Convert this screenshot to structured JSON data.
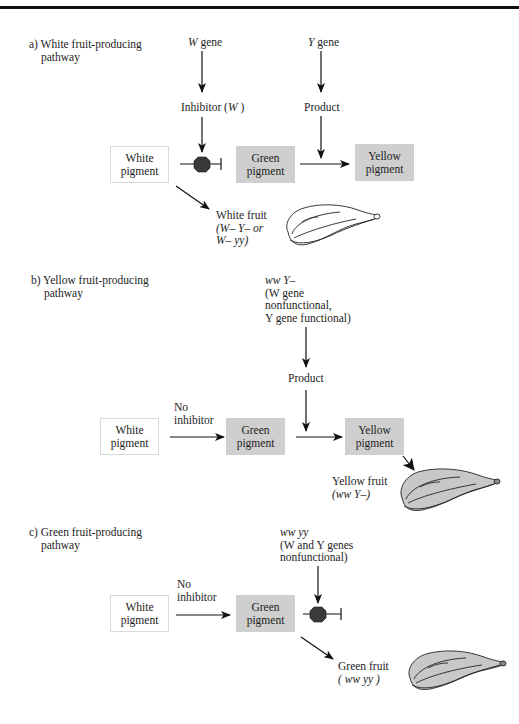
{
  "colors": {
    "pigment_box_fill": "#cfcfcf",
    "white_box_border": "#dadada",
    "inhibitor_dot": "#3a3a3a",
    "line": "#111111",
    "fruit_fill_shaded": "#c8c8c8"
  },
  "panel_a": {
    "title_line1": "a) White fruit-producing",
    "title_line2": "pathway",
    "w_gene": {
      "symbol": "W",
      "text": " gene"
    },
    "y_gene": {
      "symbol": "Y",
      "text": " gene"
    },
    "inhibitor": {
      "prefix": "Inhibitor (",
      "symbol": "W",
      "suffix": " )"
    },
    "product": "Product",
    "boxes": {
      "white": "White\npigment",
      "green": "Green\npigment",
      "yellow": "Yellow\npigment"
    },
    "fruit_label": "White fruit",
    "genotype_line1": "(W– Y– or",
    "genotype_line2": "W– yy)"
  },
  "panel_b": {
    "title_line1": "b) Yellow fruit-producing",
    "title_line2": "pathway",
    "genotype": "ww  Y–",
    "note_line1": "(W gene",
    "note_line2": "nonfunctional,",
    "note_line3": "Y gene functional)",
    "product": "Product",
    "no_inhibitor_line1": "No",
    "no_inhibitor_line2": "inhibitor",
    "boxes": {
      "white": "White\npigment",
      "green": "Green\npigment",
      "yellow": "Yellow\npigment"
    },
    "fruit_label": "Yellow fruit",
    "fruit_genotype": "(ww  Y–)"
  },
  "panel_c": {
    "title_line1": "c) Green fruit-producing",
    "title_line2": "pathway",
    "genotype": "ww yy",
    "note_line1": "(W and  Y genes",
    "note_line2": "nonfunctional)",
    "no_inhibitor_line1": "No",
    "no_inhibitor_line2": "inhibitor",
    "boxes": {
      "white": "White\npigment",
      "green": "Green\npigment"
    },
    "fruit_label": "Green fruit",
    "fruit_genotype": "( ww yy )"
  }
}
